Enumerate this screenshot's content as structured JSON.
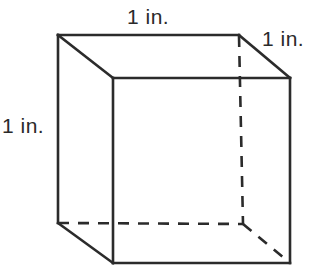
{
  "figure": {
    "type": "geometric-solid",
    "shape": "cube",
    "stroke_color": "#2b2b2b",
    "background_color": "#ffffff",
    "hidden_edge_style": "dashed",
    "visible_edge_style": "solid"
  },
  "labels": {
    "top": "1 in.",
    "right": "1 in.",
    "left": "1 in."
  },
  "geometry": {
    "vertices": {
      "back_top_left": [
        58,
        35
      ],
      "back_top_right": [
        239,
        35
      ],
      "front_top_left": [
        113,
        78
      ],
      "front_top_right": [
        290,
        78
      ],
      "back_bottom_left": [
        58,
        223
      ],
      "back_bottom_right": [
        243,
        224
      ],
      "front_bottom_left": [
        113,
        263
      ],
      "front_bottom_right": [
        290,
        263
      ]
    },
    "visible_edges": [
      [
        "back_top_left",
        "back_top_right"
      ],
      [
        "back_top_left",
        "front_top_left"
      ],
      [
        "back_top_right",
        "front_top_right"
      ],
      [
        "front_top_left",
        "front_top_right"
      ],
      [
        "back_top_left",
        "back_bottom_left"
      ],
      [
        "front_top_left",
        "front_bottom_left"
      ],
      [
        "front_top_right",
        "front_bottom_right"
      ],
      [
        "front_bottom_left",
        "front_bottom_right"
      ],
      [
        "back_bottom_left",
        "front_bottom_left"
      ]
    ],
    "hidden_edges": [
      [
        "back_top_right",
        "back_bottom_right"
      ],
      [
        "back_bottom_left",
        "back_bottom_right"
      ],
      [
        "back_bottom_right",
        "front_bottom_right"
      ]
    ]
  }
}
